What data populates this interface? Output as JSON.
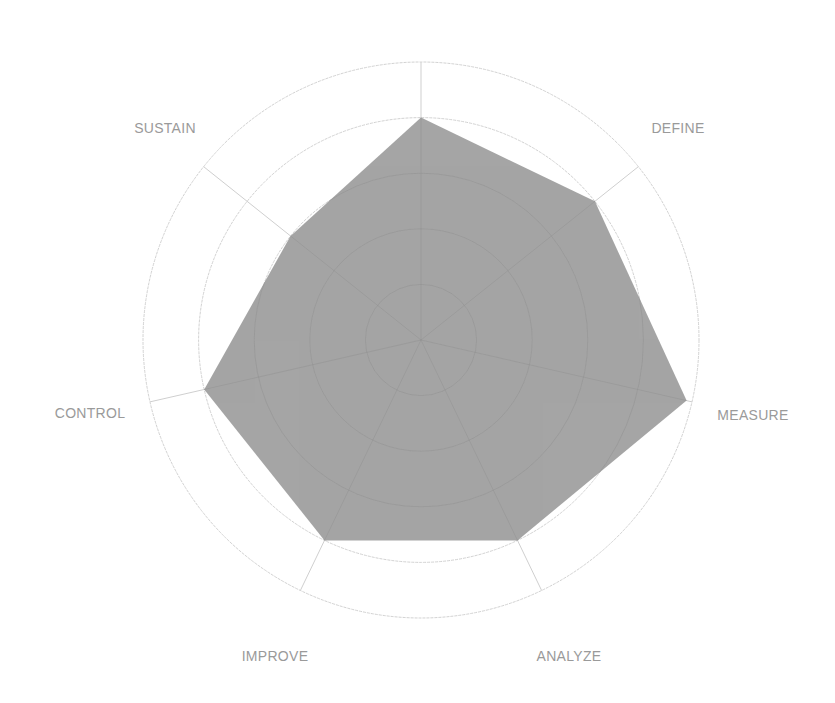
{
  "chart_data": {
    "type": "radar",
    "title": "",
    "axes": [
      "",
      "DEFINE",
      "MEASURE",
      "ANALYZE",
      "IMPROVE",
      "CONTROL",
      "SUSTAIN"
    ],
    "series": [
      {
        "name": "Score",
        "values": [
          80,
          80,
          98,
          80,
          80,
          80,
          60
        ]
      }
    ],
    "range": [
      0,
      100
    ],
    "rings": 5,
    "grid": true,
    "legend": "none",
    "colors": {
      "fill": "#a5a5a5",
      "grid": "#d2d2d2",
      "label": "#9a9a9a"
    }
  },
  "layout": {
    "cx": 421,
    "cy": 340,
    "radius": 278,
    "label_positions": [
      null,
      [
        678,
        128
      ],
      [
        753,
        415
      ],
      [
        569,
        656
      ],
      [
        275,
        656
      ],
      [
        90,
        413
      ],
      [
        165,
        128
      ]
    ]
  }
}
